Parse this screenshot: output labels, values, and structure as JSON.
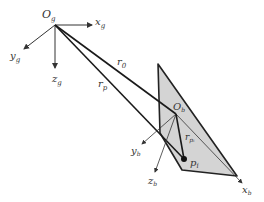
{
  "diagram": {
    "colors": {
      "line": "#1a1a1a",
      "axis": "#333333",
      "plane_fill": "#d4d4d4",
      "plane_stroke": "#222222"
    },
    "ground_frame": {
      "origin_label": "O",
      "origin_sub": "g",
      "x_label": "x",
      "x_sub": "g",
      "y_label": "y",
      "y_sub": "g",
      "z_label": "z",
      "z_sub": "g"
    },
    "body_frame": {
      "origin_label": "O",
      "origin_sub": "b",
      "x_label": "x",
      "x_sub": "b",
      "y_label": "y",
      "y_sub": "b",
      "z_label": "z",
      "z_sub": "b"
    },
    "vectors": {
      "r0": {
        "label": "r",
        "sub": "0"
      },
      "rp": {
        "label": "r",
        "sub": "p"
      },
      "rpi": {
        "label": "r",
        "sub": "pᵢ"
      }
    },
    "point": {
      "label": "p",
      "sub": "i"
    }
  }
}
